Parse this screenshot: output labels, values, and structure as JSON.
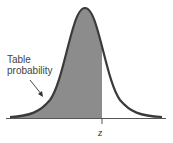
{
  "diagram": {
    "type": "normal-distribution-shaded-area",
    "annotation": {
      "line1": "Table",
      "line2": "probability"
    },
    "axis_marker": "z",
    "colors": {
      "shade": "#8c8c8c",
      "curve": "#3a3a3a",
      "axis": "#555555"
    }
  }
}
